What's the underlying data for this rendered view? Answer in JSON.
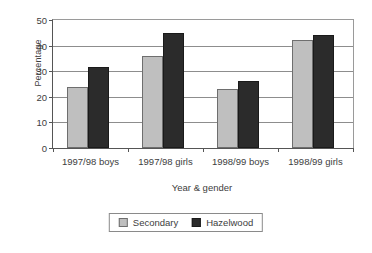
{
  "chart_data": {
    "type": "bar",
    "title": "",
    "xlabel": "Year & gender",
    "ylabel": "Percentage",
    "categories": [
      "1997/98 boys",
      "1997/98 girls",
      "1998/99 boys",
      "1998/99 girls"
    ],
    "series": [
      {
        "name": "Secondary",
        "color": "#bfbfbf",
        "values": [
          24,
          36,
          23,
          42
        ]
      },
      {
        "name": "Hazelwood",
        "color": "#2b2b2b",
        "values": [
          31.5,
          45,
          26,
          44
        ]
      }
    ],
    "ylim": [
      0,
      50
    ],
    "yticks": [
      0,
      10,
      20,
      30,
      40,
      50
    ],
    "ytick_labels": [
      "0",
      "10",
      "20",
      "30",
      "40",
      "50"
    ],
    "grid": true,
    "legend_position": "bottom-center"
  }
}
